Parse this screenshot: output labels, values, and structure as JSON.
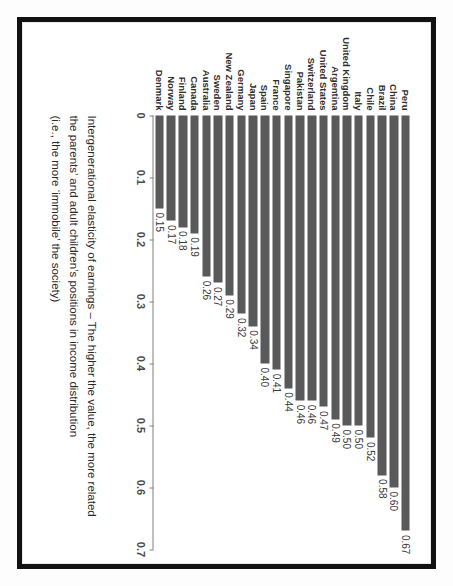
{
  "chart_data": {
    "type": "bar",
    "title": "",
    "xlabel": "",
    "ylabel": "",
    "orientation": "vertical-bars-rotated-90",
    "grid": false,
    "legend": false,
    "ylim": [
      0,
      0.7
    ],
    "tick_labels": [
      "0",
      "0.1",
      "0.2",
      "0.3",
      "0.4",
      "0.5",
      "0.6",
      "0.7"
    ],
    "tick_values": [
      0,
      0.1,
      0.2,
      0.3,
      0.4,
      0.5,
      0.6,
      0.7
    ],
    "categories": [
      "Peru",
      "China",
      "Brazil",
      "Chile",
      "Italy",
      "United Kingdom",
      "Argentina",
      "United States",
      "Switzerland",
      "Pakistan",
      "Singapore",
      "France",
      "Spain",
      "Japan",
      "Germany",
      "New Zealand",
      "Sweden",
      "Australia",
      "Canada",
      "Finland",
      "Norway",
      "Denmark"
    ],
    "values": [
      0.67,
      0.6,
      0.58,
      0.52,
      0.5,
      0.5,
      0.49,
      0.47,
      0.46,
      0.46,
      0.44,
      0.41,
      0.4,
      0.34,
      0.32,
      0.29,
      0.27,
      0.26,
      0.19,
      0.18,
      0.17,
      0.15
    ],
    "value_labels": [
      "0.67",
      "0.60",
      "0.58",
      "0.52",
      "0.50",
      "0.50",
      "0.49",
      "0.47",
      "0.46",
      "0.46",
      "0.44",
      "0.41",
      "0.40",
      "0.34",
      "0.32",
      "0.29",
      "0.27",
      "0.26",
      "0.19",
      "0.18",
      "0.17",
      "0.15"
    ],
    "bar_color": "#595959",
    "axis_color": "#7f7f7f"
  },
  "caption": {
    "line1": "Intergenerational elasticity of earnings – The higher the value, the more related",
    "line2": "the parents’ and adult children’s positions in income distribution",
    "line3": "(i.e., the more ‘immobile’ the society)"
  }
}
